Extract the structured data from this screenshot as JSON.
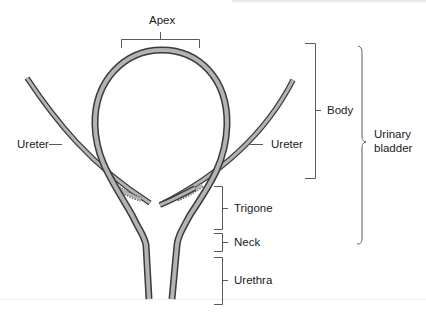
{
  "diagram": {
    "labels": {
      "apex": "Apex",
      "body": "Body",
      "ureter_left": "Ureter",
      "ureter_right": "Ureter",
      "urinary_bladder_line1": "Urinary",
      "urinary_bladder_line2": "bladder",
      "trigone": "Trigone",
      "neck": "Neck",
      "urethra": "Urethra"
    },
    "colors": {
      "wall_fill": "#b3b3b3",
      "wall_outline": "#3a3a3a",
      "bracket": "#5a5a5a",
      "text": "#1a1a1a"
    }
  }
}
